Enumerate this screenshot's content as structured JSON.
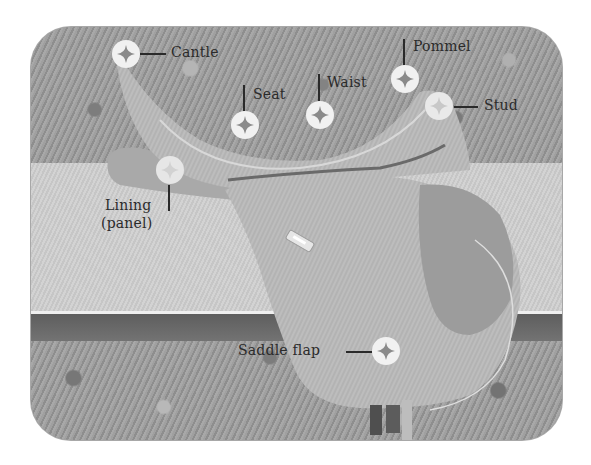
{
  "diagram": {
    "labels": {
      "cantle": "Cantle",
      "seat": "Seat",
      "waist": "Waist",
      "pommel": "Pommel",
      "stud": "Stud",
      "lining_line1": "Lining",
      "lining_line2": "(panel)",
      "saddle_flap": "Saddle flap"
    },
    "marker_icon": "four-point-star-in-circle",
    "colors": {
      "marker_fill": "#f1f1f1",
      "marker_star": "#8a8a8a",
      "label_text": "#2b2b2b",
      "leader_line": "#2a2a2a"
    }
  }
}
